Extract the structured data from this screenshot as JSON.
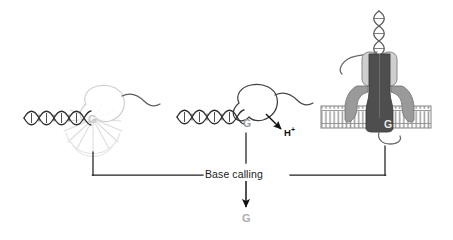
{
  "panels": [
    {
      "id": "optical",
      "name": "fluorescence-sequencing-panel",
      "base_letter": "G",
      "signal_type": "light-burst",
      "molecule": "dna-double-helix",
      "enzyme": "polymerase-blob"
    },
    {
      "id": "ion-semiconductor",
      "name": "ion-sequencing-panel",
      "base_letter": "G",
      "signal_type": "proton-release",
      "signal_label": "H",
      "signal_superscript": "+",
      "molecule": "dna-double-helix",
      "enzyme": "polymerase-blob"
    },
    {
      "id": "nanopore",
      "name": "nanopore-sequencing-panel",
      "base_letter": "G",
      "signal_type": "ionic-current",
      "molecule": "dna-double-helix",
      "membrane": "lipid-bilayer",
      "pore": "protein-nanopore",
      "motor": "motor-protein"
    }
  ],
  "process": {
    "base_calling_label": "Base calling",
    "output_base": "G"
  },
  "colors": {
    "ink": "#1a1a1a",
    "outline": "#4a4a4a",
    "faint": "#d5d5d5",
    "g_faint": "#c9c9c9",
    "g_mid": "#9a9a9a",
    "g_out": "#adadad",
    "pore_dark": "#555555",
    "pore_mid": "#8d8d8d",
    "pore_light": "#c5c5c5",
    "membrane": "#b8b8b8",
    "white": "#ffffff"
  }
}
